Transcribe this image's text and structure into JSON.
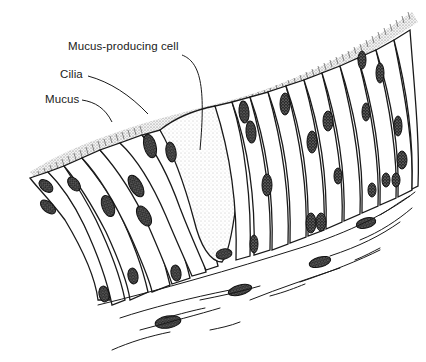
{
  "diagram": {
    "labels": {
      "mucus_producing_cell": "Mucus-producing cell",
      "cilia": "Cilia",
      "mucus": "Mucus"
    },
    "colors": {
      "ink": "#1a1a1a",
      "background": "#ffffff",
      "stipple": "#8a8a8a"
    }
  }
}
